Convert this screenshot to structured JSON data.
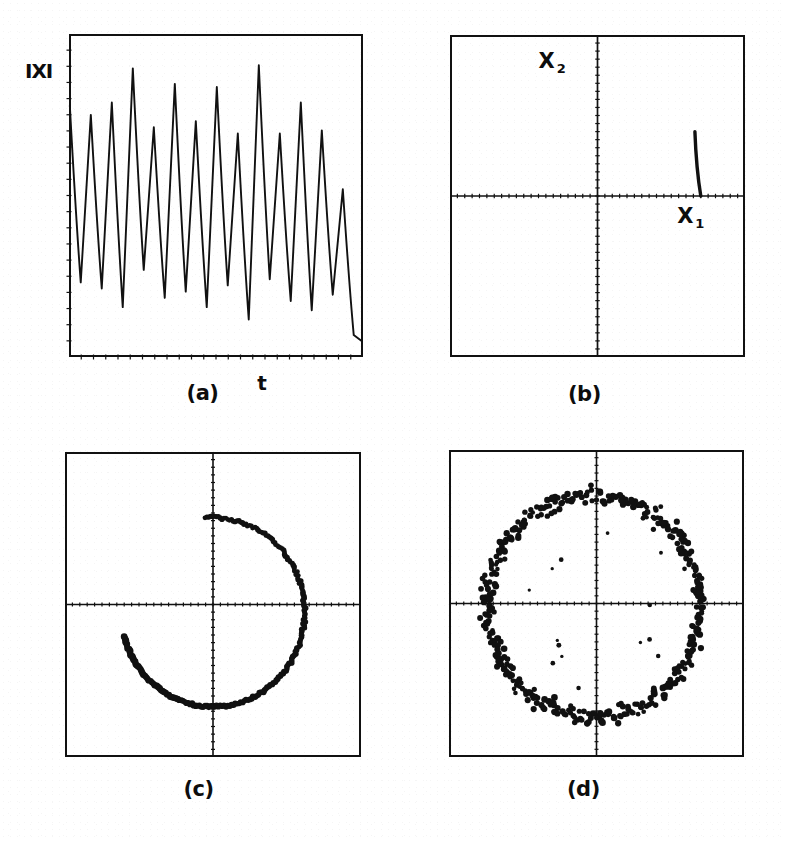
{
  "figure": {
    "background_color": "#ffffff",
    "ink_color": "#111111",
    "panels": [
      {
        "id": "a",
        "caption": "(a)",
        "type": "time-series",
        "ylabel": "IXI",
        "xlabel": "t",
        "box": {
          "x": 69,
          "y": 34,
          "w": 294,
          "h": 323
        },
        "axes_style": "box-with-ticks"
      },
      {
        "id": "b",
        "caption": "(b)",
        "type": "phase-plane",
        "xlabel": "X",
        "xlabel_sub": "1",
        "ylabel": "X",
        "ylabel_sub": "2",
        "box": {
          "x": 450,
          "y": 35,
          "w": 295,
          "h": 322
        },
        "axes_style": "crosshair-quadrants",
        "note": "single short curved trajectory arc in right half, ending on horizontal axis"
      },
      {
        "id": "c",
        "caption": "(c)",
        "type": "poincare-section",
        "box": {
          "x": 65,
          "y": 452,
          "w": 296,
          "h": 305
        },
        "axes_style": "crosshair-quadrants",
        "note": "partial ring (crescent) of points, open toward upper-left"
      },
      {
        "id": "d",
        "caption": "(d)",
        "type": "poincare-section",
        "box": {
          "x": 449,
          "y": 450,
          "w": 295,
          "h": 307
        },
        "axes_style": "crosshair-quadrants",
        "note": "complete noisy ring of scattered points"
      }
    ]
  },
  "chart_data": [
    {
      "panel": "a",
      "type": "line",
      "title": "",
      "xlabel": "t",
      "ylabel": "IXI",
      "xlim": [
        0,
        14.4
      ],
      "ylim": [
        0,
        1
      ],
      "grid": false,
      "legend": "none",
      "description": "Sharply peaked oscillation, about 14 cycles, peak amplitude fluctuating cycle to cycle, deep narrow troughs of varying depth.",
      "peaks": [
        0.79,
        0.76,
        0.8,
        0.91,
        0.72,
        0.86,
        0.74,
        0.85,
        0.7,
        0.92,
        0.7,
        0.8,
        0.71,
        0.52
      ],
      "troughs": [
        0.22,
        0.2,
        0.14,
        0.26,
        0.17,
        0.19,
        0.14,
        0.21,
        0.1,
        0.23,
        0.16,
        0.13,
        0.18,
        0.05
      ]
    },
    {
      "panel": "b",
      "type": "line",
      "title": "",
      "xlabel": "X1",
      "ylabel": "X2",
      "xlim": [
        -1,
        1
      ],
      "ylim": [
        -1,
        1
      ],
      "grid": false,
      "legend": "none",
      "description": "Nearly empty phase plane with axes crossing at centre; one short thick curved stroke in the first quadrant near the right edge, descending to meet the horizontal axis.",
      "arc": {
        "x_start": 0.66,
        "y_start": 0.4,
        "x_end": 0.7,
        "y_end": 0.0
      }
    },
    {
      "panel": "c",
      "type": "scatter",
      "title": "",
      "xlabel": "",
      "ylabel": "",
      "xlim": [
        -1,
        1
      ],
      "ylim": [
        -1,
        1
      ],
      "grid": false,
      "legend": "none",
      "description": "Poincare section forming an incomplete ring: dots trace roughly 260 degrees of a circle of radius about 0.62, starting at the top near the vertical axis, running clockwise through the right side and the bottom, ending in the lower-left; the upper-left arc is empty. Point density is highest along the bottom and right.",
      "ring": {
        "radius": 0.62,
        "center": [
          0.0,
          -0.05
        ],
        "angle_start_deg": 95,
        "angle_end_deg": -165,
        "n_points": 220
      }
    },
    {
      "panel": "d",
      "type": "scatter",
      "title": "",
      "xlabel": "",
      "ylabel": "",
      "xlim": [
        -1,
        1
      ],
      "ylim": [
        -1,
        1
      ],
      "grid": false,
      "legend": "none",
      "description": "Poincare section forming a complete but noisy closed ring of radius about 0.72 with radial scatter of roughly plus or minus 0.08, plus a few isolated points inside the ring.",
      "ring": {
        "radius": 0.72,
        "center": [
          -0.02,
          -0.02
        ],
        "radial_noise": 0.08,
        "n_points": 420
      }
    }
  ]
}
